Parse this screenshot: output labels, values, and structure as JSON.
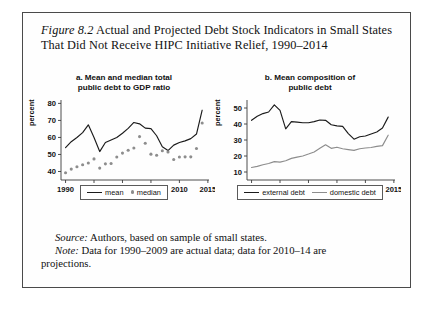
{
  "figure": {
    "number_label": "Figure 8.2",
    "caption": " Actual and Projected Debt Stock Indicators in Small States That Did Not Receive HIPC Initiative Relief, 1990–2014"
  },
  "notes": {
    "source_label": "Source:",
    "source_text": " Authors, based on sample of small states.",
    "note_label": "Note:",
    "note_text": " Data for 1990–2009 are actual data; data for 2010–14 are",
    "note_text_cont": "projections."
  },
  "colors": {
    "line_dark": "#1b1b1b",
    "line_grey": "#8d8d8d",
    "marker_grey": "#8d8d8d",
    "axis": "#3a3a3a",
    "frame": "#4a4a4a"
  },
  "chart_data": [
    {
      "id": "panel-a",
      "type": "line",
      "title": "a. Mean and median total public debt to GDP ratio",
      "title_line1": "a. Mean and median total",
      "title_line2": "public debt to GDP ratio",
      "xlabel": "",
      "ylabel": "percent",
      "xlim": [
        1989.2,
        2015.2
      ],
      "ylim": [
        35,
        82
      ],
      "xticks": [
        1990,
        1995,
        2000,
        2005,
        2010,
        2015
      ],
      "xticklabels": [
        "1990",
        "1995",
        "2000",
        "2005",
        "2010",
        "2015"
      ],
      "yticks": [
        40,
        50,
        60,
        70,
        80
      ],
      "yticklabels": [
        "40",
        "50",
        "60",
        "70",
        "80"
      ],
      "grid": false,
      "legend_position": "below-center",
      "x": [
        1990,
        1991,
        1992,
        1993,
        1994,
        1995,
        1996,
        1997,
        1998,
        1999,
        2000,
        2001,
        2002,
        2003,
        2004,
        2005,
        2006,
        2007,
        2008,
        2009,
        2010,
        2011,
        2012,
        2013,
        2014
      ],
      "series": [
        {
          "name": "mean",
          "style": "line",
          "color": "#1b1b1b",
          "values": [
            54.0,
            57.5,
            60.0,
            62.8,
            67.4,
            60.0,
            51.7,
            57.0,
            58.5,
            60.0,
            62.5,
            65.3,
            68.8,
            68.0,
            65.5,
            65.2,
            61.0,
            54.5,
            52.3,
            55.5,
            57.0,
            58.0,
            59.3,
            62.0,
            76.0
          ]
        },
        {
          "name": "median",
          "style": "markers",
          "color": "#8d8d8d",
          "values": [
            39.3,
            41.4,
            42.8,
            44.0,
            45.0,
            47.4,
            42.0,
            44.5,
            44.7,
            48.5,
            50.8,
            52.5,
            53.8,
            60.5,
            56.6,
            50.2,
            49.5,
            52.2,
            51.5,
            47.0,
            48.5,
            48.6,
            48.6,
            53.5,
            68.5
          ]
        }
      ]
    },
    {
      "id": "panel-b",
      "type": "line",
      "title": "b. Mean composition of public debt",
      "title_line1": "b. Mean composition of",
      "title_line2": "public debt",
      "xlabel": "",
      "ylabel": "percent",
      "xlim": [
        1989.2,
        2015.2
      ],
      "ylim": [
        5,
        55
      ],
      "xticks": [
        1990,
        1995,
        2000,
        2005,
        2010,
        2015
      ],
      "xticklabels": [
        "1990",
        "1995",
        "2000",
        "2005",
        "2010",
        "2015"
      ],
      "yticks": [
        10,
        20,
        30,
        40,
        50
      ],
      "yticklabels": [
        "10",
        "20",
        "30",
        "40",
        "50"
      ],
      "grid": false,
      "legend_position": "below-center",
      "x": [
        1990,
        1991,
        1992,
        1993,
        1994,
        1995,
        1996,
        1997,
        1998,
        1999,
        2000,
        2001,
        2002,
        2003,
        2004,
        2005,
        2006,
        2007,
        2008,
        2009,
        2010,
        2011,
        2012,
        2013,
        2014
      ],
      "series": [
        {
          "name": "external debt",
          "style": "line",
          "color": "#1b1b1b",
          "values": [
            42.3,
            44.8,
            46.5,
            47.5,
            52.0,
            48.5,
            37.0,
            41.5,
            41.2,
            40.8,
            40.8,
            41.5,
            42.5,
            42.3,
            39.5,
            38.8,
            38.5,
            34.0,
            30.5,
            32.0,
            32.5,
            33.8,
            35.0,
            37.5,
            44.3
          ]
        },
        {
          "name": "domestic debt",
          "style": "line",
          "color": "#8d8d8d",
          "values": [
            12.8,
            13.5,
            14.5,
            15.3,
            16.5,
            16.2,
            17.0,
            18.5,
            19.3,
            20.0,
            21.2,
            22.5,
            24.8,
            27.0,
            24.8,
            25.5,
            24.5,
            24.0,
            23.5,
            24.5,
            25.0,
            25.3,
            26.0,
            26.5,
            33.0
          ]
        }
      ]
    }
  ],
  "legends": {
    "panel_a": [
      {
        "label": "mean",
        "marker": "line",
        "color": "#1b1b1b"
      },
      {
        "label": "median",
        "marker": "dot",
        "color": "#8d8d8d"
      }
    ],
    "panel_b": [
      {
        "label": "external debt",
        "marker": "line",
        "color": "#1b1b1b"
      },
      {
        "label": "domestic debt",
        "marker": "line-grey",
        "color": "#8d8d8d"
      }
    ]
  }
}
